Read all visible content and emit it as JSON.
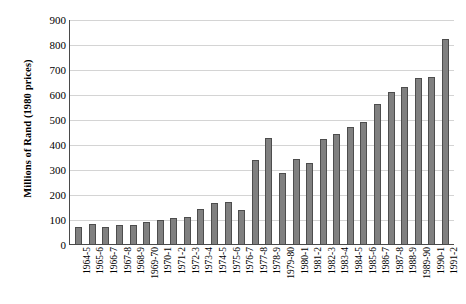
{
  "chart_data": {
    "type": "bar",
    "title": "",
    "subtitle": "",
    "xlabel": "",
    "ylabel": "Millions of Rand (1980 prices)",
    "ylim": [
      0,
      900
    ],
    "yticks": [
      0,
      100,
      200,
      300,
      400,
      500,
      600,
      700,
      800,
      900
    ],
    "ytick_labels": [
      "0",
      "100",
      "200",
      "300",
      "400",
      "500",
      "600",
      "700",
      "800",
      "900"
    ],
    "grid": true,
    "legend": null,
    "bar_color": "#808080",
    "bar_edge_color": "#4d4d4d",
    "categories": [
      "1964-5",
      "1965-6",
      "1966-7",
      "1967-8",
      "1968-9",
      "1969-70",
      "1970-1",
      "1971-2",
      "1972-3",
      "1973-4",
      "1974-5",
      "1975-6",
      "1976-7",
      "1977-8",
      "1978-9",
      "1979-80",
      "1980-1",
      "1981-2",
      "1982-3",
      "1983-4",
      "1984-5",
      "1985-6",
      "1986-7",
      "1987-8",
      "1988-9",
      "1989-90",
      "1990-1",
      "1991-2"
    ],
    "values": [
      70,
      80,
      70,
      75,
      75,
      90,
      95,
      105,
      108,
      140,
      165,
      168,
      135,
      335,
      425,
      285,
      340,
      325,
      420,
      440,
      470,
      490,
      560,
      610,
      630,
      665,
      670,
      820
    ]
  }
}
